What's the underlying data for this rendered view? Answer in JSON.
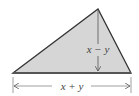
{
  "diagram": {
    "shape": "triangle",
    "fill_color": "#d6d6d6",
    "stroke_color": "#333333",
    "vertices": {
      "left": [
        13,
        73
      ],
      "apex": [
        98,
        9
      ],
      "right": [
        131,
        73
      ]
    },
    "height_label": "x − y",
    "base_label": "x + y"
  }
}
